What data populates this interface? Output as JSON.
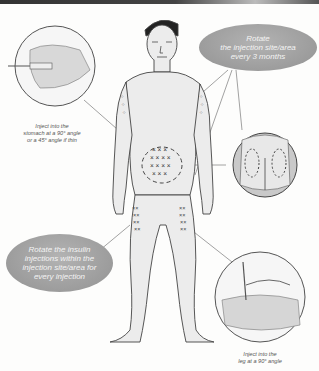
{
  "diagram": {
    "captions": {
      "stomach": [
        "Inject into the",
        "stomach at a 90° angle",
        "or a 45° angle if thin"
      ],
      "leg": [
        "Inject into the",
        "leg at a 90° angle"
      ]
    },
    "bubbles": {
      "rotate_site": [
        "Rotate",
        "the injection site/area",
        "every 3 months"
      ],
      "rotate_within": [
        "Rotate the insulin",
        "injections within the",
        "injection site/area for",
        "every injection"
      ]
    },
    "sites": [
      "arms",
      "stomach",
      "thighs",
      "buttocks"
    ],
    "marker_symbol": "×",
    "colors": {
      "background": "#fdfdfc",
      "bubble_fill": "#a3a3a3",
      "bubble_text": "#f4f4f4",
      "line": "#777777",
      "skin": "#e9e9e9",
      "outline": "#444444"
    }
  }
}
